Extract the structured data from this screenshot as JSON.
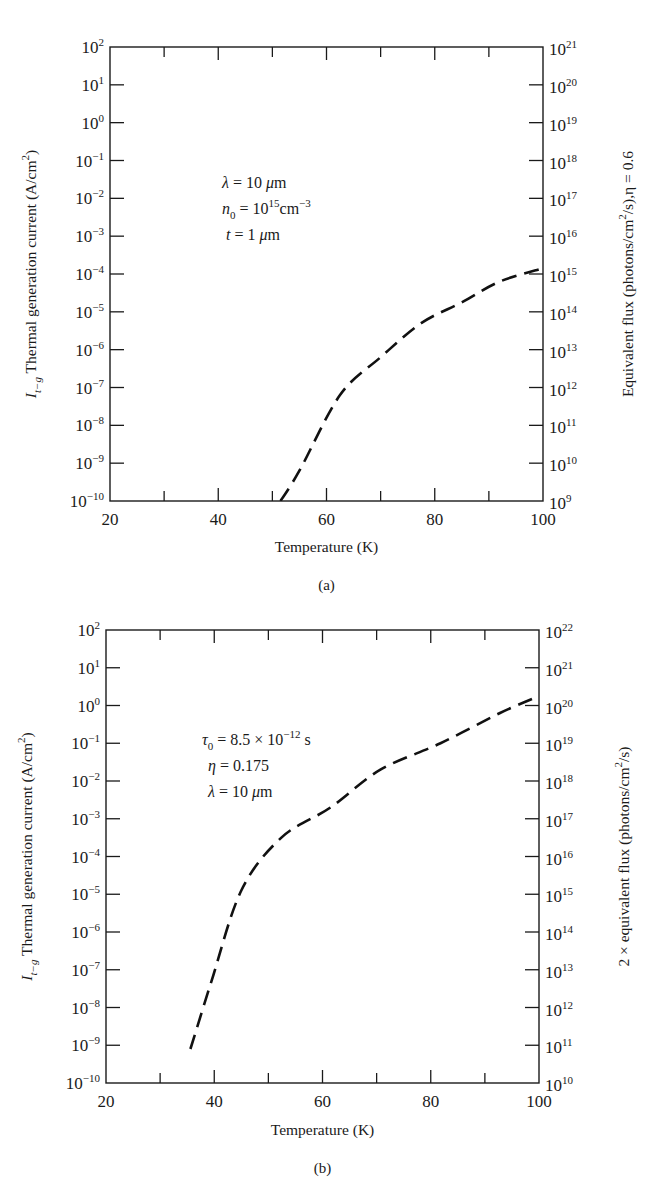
{
  "figure": {
    "panels": [
      "(a)",
      "(b)"
    ]
  },
  "chart_data": [
    {
      "type": "line",
      "panel_label": "(a)",
      "title": "",
      "xlabel": "Temperature (K)",
      "ylabel": "I_{t-g} Thermal generation current (A/cm^2)",
      "ylabel_right": "Equivalent flux (photons/cm^2/s), η = 0.6",
      "x_ticks": [
        20,
        40,
        60,
        80,
        100
      ],
      "x_minor_ticks": [
        30,
        50,
        70,
        90
      ],
      "xlim": [
        20,
        100
      ],
      "y_scale": "log",
      "ylim": [
        1e-10,
        100.0
      ],
      "y_tick_exponents": [
        2,
        1,
        0,
        -1,
        -2,
        -3,
        -4,
        -5,
        -6,
        -7,
        -8,
        -9,
        -10
      ],
      "y_right_tick_exponents": [
        21,
        20,
        19,
        18,
        17,
        16,
        15,
        14,
        13,
        12,
        11,
        10,
        9
      ],
      "annotations": [
        "λ = 10 μm",
        "n0 = 10^15 cm^-3",
        "t = 1 μm"
      ],
      "grid": false,
      "legend": null,
      "series": [
        {
          "name": "I_t-g",
          "style": "dashed",
          "x": [
            51.5,
            55,
            62.5,
            70,
            77.5,
            85,
            92,
            100
          ],
          "log10_y": [
            -10.0,
            -9.2,
            -7.2,
            -6.2,
            -5.3,
            -4.75,
            -4.2,
            -3.85
          ]
        }
      ]
    },
    {
      "type": "line",
      "panel_label": "(b)",
      "title": "",
      "xlabel": "Temperature (K)",
      "ylabel": "I_{t-g} Thermal generation current (A/cm^2)",
      "ylabel_right": "2 × equivalent flux (photons/cm^2/s)",
      "x_ticks": [
        20,
        40,
        60,
        80,
        100
      ],
      "x_minor_ticks": [
        30,
        50,
        70,
        90
      ],
      "xlim": [
        20,
        100
      ],
      "y_scale": "log",
      "ylim": [
        1e-10,
        100.0
      ],
      "y_tick_exponents": [
        2,
        1,
        0,
        -1,
        -2,
        -3,
        -4,
        -5,
        -6,
        -7,
        -8,
        -9,
        -10
      ],
      "y_right_tick_exponents": [
        22,
        21,
        20,
        19,
        18,
        17,
        16,
        15,
        14,
        13,
        12,
        11,
        10
      ],
      "annotations": [
        "τ0 = 8.5 × 10^-12 s",
        "η = 0.175",
        "λ = 10 μm"
      ],
      "grid": false,
      "legend": null,
      "series": [
        {
          "name": "I_t-g",
          "style": "dashed",
          "x": [
            35.6,
            39.5,
            45,
            52.4,
            61.5,
            70.7,
            81.8,
            92.8,
            100
          ],
          "log10_y": [
            -9.1,
            -7.3,
            -4.9,
            -3.5,
            -2.7,
            -1.7,
            -1.0,
            -0.2,
            0.25
          ]
        }
      ]
    }
  ],
  "panels": [
    {
      "frame": {
        "left": 110,
        "top": 47,
        "right": 543,
        "bottom": 501
      },
      "caption": "(a)",
      "caption_y": 590,
      "xlabel_y": 552,
      "ylabel_left_parts": {
        "main": "I",
        "sub": "t−g",
        "rest": " Thermal generation current (A/cm",
        "sup": "2",
        "end": ")"
      },
      "ylabel_right_parts": {
        "pre": "Equivalent flux (photons/cm",
        "sup": "2",
        "post": "/s),η = 0.6"
      },
      "annotations": [
        {
          "x": 222,
          "y": 188,
          "parts": [
            {
              "t": "λ",
              "i": true
            },
            {
              "t": " = 10 "
            },
            {
              "t": "μ",
              "i": true
            },
            {
              "t": "m"
            }
          ]
        },
        {
          "x": 222,
          "y": 214,
          "parts": [
            {
              "t": "n",
              "i": true
            },
            {
              "t": "0",
              "sub": true
            },
            {
              "t": " = 10"
            },
            {
              "t": "15",
              "sup": true
            },
            {
              "t": "cm"
            },
            {
              "t": "−3",
              "sup": true
            }
          ]
        },
        {
          "x": 226,
          "y": 240,
          "parts": [
            {
              "t": "t",
              "i": true
            },
            {
              "t": " = 1 "
            },
            {
              "t": "μ",
              "i": true
            },
            {
              "t": "m"
            }
          ]
        }
      ]
    },
    {
      "frame": {
        "left": 106,
        "top": 630,
        "right": 539,
        "bottom": 1083
      },
      "caption": "(b)",
      "caption_y": 1173,
      "xlabel_y": 1135,
      "ylabel_left_parts": {
        "main": "I",
        "sub": "t−g",
        "rest": " Thermal generation current (A/cm",
        "sup": "2",
        "end": ")"
      },
      "ylabel_right_parts": {
        "pre": "2 × equivalent flux (photons/cm",
        "sup": "2",
        "post": "/s)"
      },
      "annotations": [
        {
          "x": 202,
          "y": 745,
          "parts": [
            {
              "t": "τ",
              "i": true
            },
            {
              "t": "0",
              "sub": true
            },
            {
              "t": " = 8.5 × 10"
            },
            {
              "t": "−12",
              "sup": true
            },
            {
              "t": " s"
            }
          ]
        },
        {
          "x": 208,
          "y": 771,
          "parts": [
            {
              "t": "η",
              "i": true
            },
            {
              "t": " = 0.175"
            }
          ]
        },
        {
          "x": 208,
          "y": 797,
          "parts": [
            {
              "t": "λ",
              "i": true
            },
            {
              "t": " = 10 "
            },
            {
              "t": "μ",
              "i": true
            },
            {
              "t": "m"
            }
          ]
        }
      ]
    }
  ]
}
